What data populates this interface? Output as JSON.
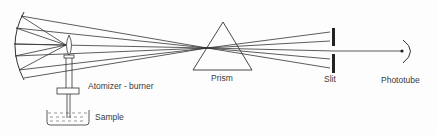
{
  "labels": {
    "atomizer_burner": "Atomizer - burner",
    "sample": "Sample",
    "prism": "Prism",
    "slit": "Slit",
    "phototube": "Phototube"
  },
  "colors": {
    "line": "#333333",
    "background": "#fdfdfd"
  }
}
